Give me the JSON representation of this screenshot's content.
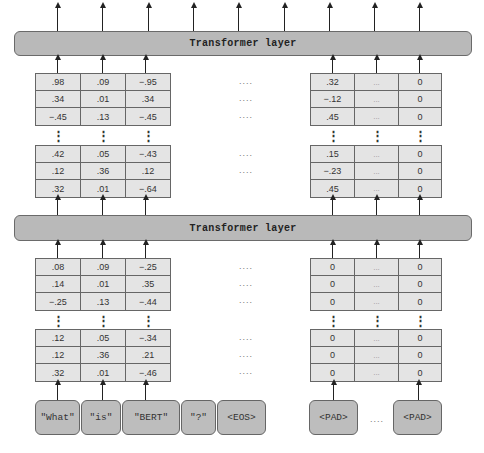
{
  "layers": {
    "top": {
      "label": "Transformer layer"
    },
    "bottom": {
      "label": "Transformer layer"
    }
  },
  "upper_embeddings": {
    "left": {
      "top_rows": [
        [
          ".98",
          ".09",
          "−.95"
        ],
        [
          ".34",
          ".01",
          ".34"
        ],
        [
          "−.45",
          ".13",
          "−.45"
        ]
      ],
      "bottom_rows": [
        [
          ".42",
          ".05",
          "−.43"
        ],
        [
          ".12",
          ".36",
          ".12"
        ],
        [
          ".32",
          ".01",
          "−.64"
        ]
      ]
    },
    "middle_ellipsis": "....",
    "right": {
      "top_rows": [
        [
          ".32",
          "...",
          "0"
        ],
        [
          "−.12",
          "...",
          "0"
        ],
        [
          ".45",
          "...",
          "0"
        ]
      ],
      "bottom_rows": [
        [
          ".15",
          "...",
          "0"
        ],
        [
          "−.23",
          "...",
          "0"
        ],
        [
          ".45",
          "...",
          "0"
        ]
      ]
    }
  },
  "lower_embeddings": {
    "left": {
      "top_rows": [
        [
          ".08",
          ".09",
          "−.25"
        ],
        [
          ".14",
          ".01",
          ".35"
        ],
        [
          "−.25",
          ".13",
          "−.44"
        ]
      ],
      "bottom_rows": [
        [
          ".12",
          ".05",
          "−.34"
        ],
        [
          ".12",
          ".36",
          ".21"
        ],
        [
          ".32",
          ".01",
          "−.46"
        ]
      ]
    },
    "middle_ellipsis": "....",
    "right": {
      "top_rows": [
        [
          "0",
          "...",
          "0"
        ],
        [
          "0",
          "...",
          "0"
        ],
        [
          "0",
          "...",
          "0"
        ]
      ],
      "bottom_rows": [
        [
          "0",
          "...",
          "0"
        ],
        [
          "0",
          "...",
          "0"
        ],
        [
          "0",
          "...",
          "0"
        ]
      ]
    }
  },
  "vertical_ellipsis": "⋮",
  "tokens": [
    {
      "label": "\"What\""
    },
    {
      "label": "\"is\""
    },
    {
      "label": "\"BERT\""
    },
    {
      "label": "\"?\""
    },
    {
      "label": "<EOS>"
    },
    {
      "label": "<PAD>"
    },
    {
      "label": "<PAD>"
    }
  ],
  "token_ellipsis": "....",
  "colors": {
    "layer_fill": "#b9b9b9",
    "cell_fill": "#e4e4e4",
    "token_fill": "#bdbdbd",
    "stroke": "#666666"
  }
}
